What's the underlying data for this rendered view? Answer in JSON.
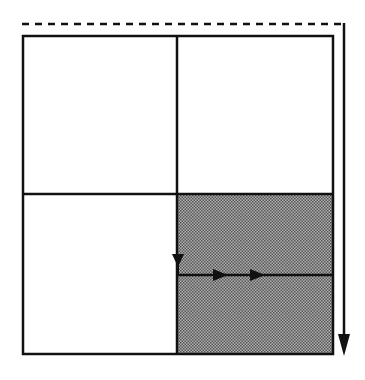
{
  "diagram": {
    "type": "quadrant-scan-path",
    "grid": {
      "rows": 2,
      "cols": 2,
      "cells": [
        {
          "row": 0,
          "col": 0,
          "filled": false
        },
        {
          "row": 0,
          "col": 1,
          "filled": false
        },
        {
          "row": 1,
          "col": 0,
          "filled": false
        },
        {
          "row": 1,
          "col": 1,
          "filled": true
        }
      ]
    },
    "colors": {
      "stroke": "#111111",
      "fill_hatch": "#888888",
      "background": "#ffffff"
    },
    "paths": [
      {
        "name": "outer-dashed-path",
        "style": "dashed",
        "description": "dashed across top, then solid down the right side with arrowhead"
      },
      {
        "name": "inner-path",
        "style": "solid",
        "description": "arrow down into bottom-right quadrant, then right with two arrowheads"
      }
    ],
    "caption": ""
  }
}
